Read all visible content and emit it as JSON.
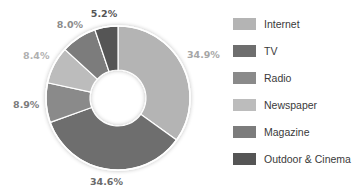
{
  "chart_data": {
    "type": "pie",
    "variant": "donut",
    "title": "",
    "categories": [
      "Internet",
      "TV",
      "Radio",
      "Newspaper",
      "Magazine",
      "Outdoor & Cinema"
    ],
    "values": [
      34.9,
      34.6,
      8.9,
      8.4,
      8.0,
      5.2
    ],
    "labels": [
      "34.9%",
      "34.6%",
      "8.9%",
      "8.4%",
      "8.0%",
      "5.2%"
    ],
    "colors": [
      "#b4b4b4",
      "#6e6e6e",
      "#8a8a8a",
      "#bcbcbc",
      "#7c7c7c",
      "#555555"
    ],
    "label_colors": [
      "#a6a6a6",
      "#6a6a6a",
      "#7c7c7c",
      "#b0b0b0",
      "#8c8c8c",
      "#555555"
    ],
    "legend_position": "right",
    "start_angle": "top",
    "direction": "clockwise"
  },
  "legend": {
    "items": [
      {
        "label": "Internet",
        "color": "#b4b4b4"
      },
      {
        "label": "TV",
        "color": "#6e6e6e"
      },
      {
        "label": "Radio",
        "color": "#8a8a8a"
      },
      {
        "label": "Newspaper",
        "color": "#bcbcbc"
      },
      {
        "label": "Magazine",
        "color": "#7c7c7c"
      },
      {
        "label": "Outdoor & Cinema",
        "color": "#555555"
      }
    ]
  }
}
